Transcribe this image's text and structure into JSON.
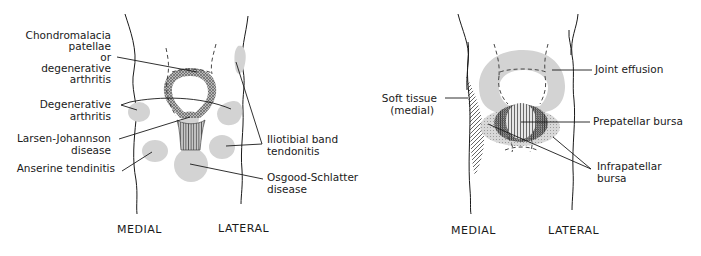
{
  "left_panel": {
    "labels": {
      "chondromalacia_1": "Chondromalacia",
      "chondromalacia_2": "patellae",
      "chondromalacia_3": "or",
      "chondromalacia_4": "degenerative",
      "chondromalacia_5": "arthritis",
      "degenerative_1": "Degenerative",
      "degenerative_2": "arthritis",
      "larsen_1": "Larsen-Johannson",
      "larsen_2": "disease",
      "anserine": "Anserine tendinitis",
      "iliotibial_1": "Iliotibial band",
      "iliotibial_2": "tendonitis",
      "osgood_1": "Osgood-Schlatter",
      "osgood_2": "disease"
    },
    "captions": {
      "medial": "MEDIAL",
      "lateral": "LATERAL"
    }
  },
  "right_panel": {
    "labels": {
      "soft_tissue_1": "Soft tissue",
      "soft_tissue_2": "(medial)",
      "joint_effusion": "Joint effusion",
      "prepatellar": "Prepatellar bursa",
      "infrapatellar_1": "Infrapatellar",
      "infrapatellar_2": "bursa"
    },
    "captions": {
      "medial": "MEDIAL",
      "lateral": "LATERAL"
    }
  },
  "colors": {
    "ink": "#1a1a1a",
    "shade": "#d3d3d3",
    "background": "#ffffff"
  }
}
